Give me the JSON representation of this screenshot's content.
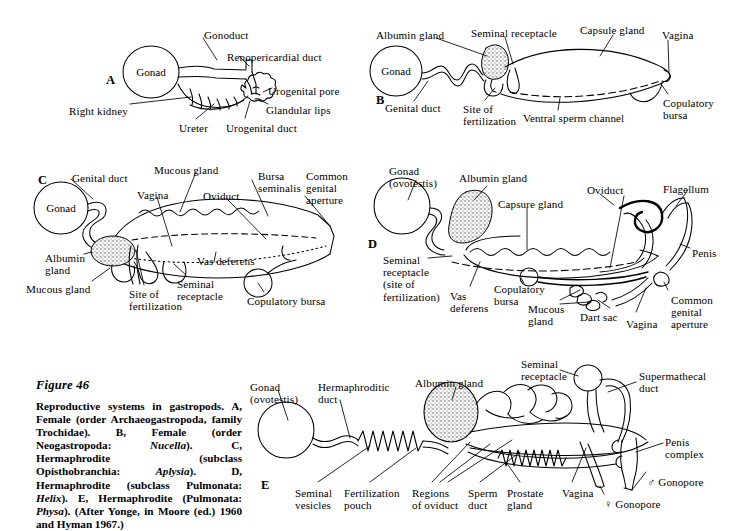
{
  "figure": {
    "title": "Figure 46",
    "caption_segments": [
      {
        "t": "Reproductive systems in gastropods. A, Female (order Archaeogastropoda, family Trochidae). B, Female (order Neogastropoda: ",
        "i": false
      },
      {
        "t": "Nucella",
        "i": true
      },
      {
        "t": "). C, Hermaphrodite (subclass Opisthobranchia: ",
        "i": false
      },
      {
        "t": "Aplysia",
        "i": true
      },
      {
        "t": "). D, Hermaphrodite (subclass Pulmonata: ",
        "i": false
      },
      {
        "t": "Helix",
        "i": true
      },
      {
        "t": "). E, Hermaphrodite (Pulmonata: ",
        "i": false
      },
      {
        "t": "Physa",
        "i": true
      },
      {
        "t": "). (After Yonge, in Moore (ed.) 1960 and Hyman 1967.)",
        "i": false
      }
    ],
    "caption_plain": "Reproductive systems in gastropods. A, Female (order Archaeogastropoda, family Trochidae). B, Female (order Neogastropoda: Nucella). C, Hermaphrodite (subclass Opisthobranchia: Aplysia). D, Hermaphrodite (subclass Pulmonata: Helix). E, Hermaphrodite (Pulmonata: Physa). (After Yonge, in Moore (ed.) 1960 and Hyman 1967.)"
  },
  "panels": [
    {
      "id": "A",
      "letter": "A",
      "letter_pos": {
        "x": 106,
        "y": 73
      },
      "organ_labels": [
        {
          "name": "gonad",
          "text": "Gonad",
          "x": 151,
          "y": 72
        }
      ],
      "labels": [
        {
          "name": "gonoduct",
          "text": "Gonoduct",
          "x": 204,
          "y": 29,
          "align": "left"
        },
        {
          "name": "renopericardial-duct",
          "text": "Renopericardial duct",
          "x": 227,
          "y": 51,
          "align": "left"
        },
        {
          "name": "urogenital-pore",
          "text": "Urogenital pore",
          "x": 268,
          "y": 85,
          "align": "left"
        },
        {
          "name": "glandular-lips",
          "text": "Glandular lips",
          "x": 266,
          "y": 104,
          "align": "left"
        },
        {
          "name": "right-kidney",
          "text": "Right kidney",
          "x": 69,
          "y": 105,
          "align": "left"
        },
        {
          "name": "ureter",
          "text": "Ureter",
          "x": 179,
          "y": 122,
          "align": "left"
        },
        {
          "name": "urogenital-duct",
          "text": "Urogenital duct",
          "x": 226,
          "y": 122,
          "align": "left"
        }
      ]
    },
    {
      "id": "B",
      "letter": "B",
      "letter_pos": {
        "x": 376,
        "y": 93
      },
      "organ_labels": [
        {
          "name": "gonad",
          "text": "Gonad",
          "x": 396,
          "y": 71
        }
      ],
      "labels": [
        {
          "name": "albumin-gland",
          "text": "Albumin gland",
          "x": 376,
          "y": 29,
          "align": "left"
        },
        {
          "name": "seminal-receptacle",
          "text": "Seminal receptacle",
          "x": 471,
          "y": 27,
          "align": "left"
        },
        {
          "name": "capsule-gland",
          "text": "Capsule gland",
          "x": 580,
          "y": 24,
          "align": "left"
        },
        {
          "name": "vagina",
          "text": "Vagina",
          "x": 662,
          "y": 29,
          "align": "left"
        },
        {
          "name": "genital-duct",
          "text": "Genital duct",
          "x": 385,
          "y": 102,
          "align": "left"
        },
        {
          "name": "site-of-fertilization",
          "text": "Site of\nfertilization",
          "x": 463,
          "y": 103,
          "align": "left"
        },
        {
          "name": "ventral-sperm-channel",
          "text": "Ventral sperm channel",
          "x": 523,
          "y": 112,
          "align": "left"
        },
        {
          "name": "copulatory-bursa",
          "text": "Copulatory\nbursa",
          "x": 663,
          "y": 97,
          "align": "left"
        }
      ]
    },
    {
      "id": "C",
      "letter": "C",
      "letter_pos": {
        "x": 38,
        "y": 173
      },
      "organ_labels": [
        {
          "name": "gonad",
          "text": "Gonad",
          "x": 61,
          "y": 208
        }
      ],
      "labels": [
        {
          "name": "genital-duct",
          "text": "Genital duct",
          "x": 72,
          "y": 172,
          "align": "left"
        },
        {
          "name": "mucous-gland-top",
          "text": "Mucous gland",
          "x": 154,
          "y": 164,
          "align": "left"
        },
        {
          "name": "bursa-seminalis",
          "text": "Bursa\nseminalis",
          "x": 258,
          "y": 170,
          "align": "left"
        },
        {
          "name": "common-genital-aperture",
          "text": "Common\ngenital\naperture",
          "x": 306,
          "y": 170,
          "align": "left"
        },
        {
          "name": "vagina",
          "text": "Vagina",
          "x": 137,
          "y": 189,
          "align": "left"
        },
        {
          "name": "oviduct",
          "text": "Oviduct",
          "x": 203,
          "y": 190,
          "align": "left"
        },
        {
          "name": "albumin-gland",
          "text": "Albumin\ngland",
          "x": 45,
          "y": 252,
          "align": "left"
        },
        {
          "name": "vas-deferens",
          "text": "Vas deferens",
          "x": 197,
          "y": 255,
          "align": "left"
        },
        {
          "name": "mucous-gland-bottom",
          "text": "Mucous gland",
          "x": 26,
          "y": 283,
          "align": "left"
        },
        {
          "name": "site-of-fertilization",
          "text": "Site of\nfertilization",
          "x": 129,
          "y": 288,
          "align": "left"
        },
        {
          "name": "seminal-receptacle",
          "text": "Seminal\nreceptacle",
          "x": 177,
          "y": 278,
          "align": "left"
        },
        {
          "name": "copulatory-bursa",
          "text": "Copulatory bursa",
          "x": 247,
          "y": 295,
          "align": "left"
        }
      ]
    },
    {
      "id": "D",
      "letter": "D",
      "letter_pos": {
        "x": 368,
        "y": 237
      },
      "organ_labels": [],
      "labels": [
        {
          "name": "gonad-ovotestis",
          "text": "Gonad\n(ovotestis)",
          "x": 389,
          "y": 165,
          "align": "left"
        },
        {
          "name": "albumin-gland",
          "text": "Albumin gland",
          "x": 459,
          "y": 172,
          "align": "left"
        },
        {
          "name": "capsure-gland",
          "text": "Capsure gland",
          "x": 498,
          "y": 198,
          "align": "left"
        },
        {
          "name": "oviduct",
          "text": "Oviduct",
          "x": 587,
          "y": 184,
          "align": "left"
        },
        {
          "name": "flagellum",
          "text": "Flagellum",
          "x": 663,
          "y": 183,
          "align": "left"
        },
        {
          "name": "penis",
          "text": "Penis",
          "x": 692,
          "y": 247,
          "align": "left"
        },
        {
          "name": "seminal-receptacle",
          "text": "Seminal\nreceptacle\n(site of\nfertilization)",
          "x": 383,
          "y": 254,
          "align": "left"
        },
        {
          "name": "vas-deferens",
          "text": "Vas\ndeferens",
          "x": 450,
          "y": 290,
          "align": "left"
        },
        {
          "name": "copulatory-bursa",
          "text": "Copulatory\nbursa",
          "x": 494,
          "y": 283,
          "align": "left"
        },
        {
          "name": "mucous-gland",
          "text": "Mucous\ngland",
          "x": 528,
          "y": 303,
          "align": "left"
        },
        {
          "name": "dart-sac",
          "text": "Dart sac",
          "x": 580,
          "y": 311,
          "align": "left"
        },
        {
          "name": "vagina",
          "text": "Vagina",
          "x": 626,
          "y": 318,
          "align": "left"
        },
        {
          "name": "common-genital-aperture",
          "text": "Common\ngenital\naperture",
          "x": 671,
          "y": 294,
          "align": "left"
        }
      ]
    },
    {
      "id": "E",
      "letter": "E",
      "letter_pos": {
        "x": 261,
        "y": 478
      },
      "organ_labels": [],
      "labels": [
        {
          "name": "gonad-ovotestis",
          "text": "Gonad\n(ovotestis)",
          "x": 250,
          "y": 381,
          "align": "left"
        },
        {
          "name": "hermaphroditic-duct",
          "text": "Hermaphroditic\nduct",
          "x": 318,
          "y": 381,
          "align": "left"
        },
        {
          "name": "albumin-gland",
          "text": "Albumin gland",
          "x": 415,
          "y": 377,
          "align": "left"
        },
        {
          "name": "seminal-receptacle",
          "text": "Seminal\nreceptacle",
          "x": 521,
          "y": 358,
          "align": "left"
        },
        {
          "name": "supermathecal-duct",
          "text": "Supermathecal\nduct",
          "x": 639,
          "y": 370,
          "align": "left"
        },
        {
          "name": "penis-complex",
          "text": "Penis\ncomplex",
          "x": 665,
          "y": 436,
          "align": "left"
        },
        {
          "name": "seminal-vesicles",
          "text": "Seminal\nvesicles",
          "x": 295,
          "y": 487,
          "align": "left"
        },
        {
          "name": "fertilization-pouch",
          "text": "Fertilization\npouch",
          "x": 344,
          "y": 487,
          "align": "left"
        },
        {
          "name": "regions-of-oviduct",
          "text": "Regions\nof oviduct",
          "x": 412,
          "y": 487,
          "align": "left"
        },
        {
          "name": "sperm-duct",
          "text": "Sperm\nduct",
          "x": 468,
          "y": 487,
          "align": "left"
        },
        {
          "name": "prostate-gland",
          "text": "Prostate\ngland",
          "x": 507,
          "y": 487,
          "align": "left"
        },
        {
          "name": "vagina",
          "text": "Vagina",
          "x": 562,
          "y": 487,
          "align": "left"
        },
        {
          "name": "female-gonopore",
          "text": "♀ Gonopore",
          "x": 604,
          "y": 498,
          "align": "left"
        },
        {
          "name": "male-gonopore",
          "text": "♂ Gonopore",
          "x": 647,
          "y": 476,
          "align": "left"
        }
      ]
    }
  ],
  "style": {
    "background": "#ffffff",
    "ink": "#000000",
    "stipple": "#6d6d6d"
  }
}
